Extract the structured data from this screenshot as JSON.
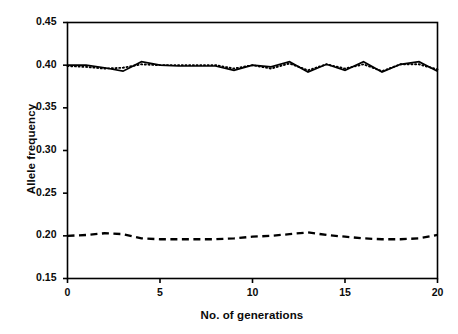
{
  "chart_data": {
    "type": "line",
    "title": "",
    "subtitle": "",
    "xlabel": "No. of generations",
    "ylabel": "Allele frequency",
    "xlim": [
      0,
      20
    ],
    "ylim": [
      0.15,
      0.45
    ],
    "xticks": [
      0,
      5,
      10,
      15,
      20
    ],
    "xtick_labels": [
      "0",
      "5",
      "10",
      "15",
      "20"
    ],
    "yticks": [
      0.15,
      0.2,
      0.25,
      0.3,
      0.35,
      0.4,
      0.45
    ],
    "ytick_labels": [
      "0.15",
      "0.20",
      "0.25",
      "0.30",
      "0.35",
      "0.40",
      "0.45"
    ],
    "grid": false,
    "legend": null,
    "legend_position": "none",
    "annotations": [],
    "x": [
      0,
      1,
      2,
      3,
      4,
      5,
      6,
      7,
      8,
      9,
      10,
      11,
      12,
      13,
      14,
      15,
      16,
      17,
      18,
      19,
      20
    ],
    "series": [
      {
        "name": "solid-line",
        "style": "solid",
        "color": "#000000",
        "values": [
          0.4,
          0.4,
          0.397,
          0.393,
          0.404,
          0.4,
          0.399,
          0.399,
          0.399,
          0.394,
          0.4,
          0.398,
          0.404,
          0.392,
          0.401,
          0.394,
          0.404,
          0.392,
          0.401,
          0.404,
          0.393
        ]
      },
      {
        "name": "dotted-line",
        "style": "dotted",
        "color": "#000000",
        "values": [
          0.399,
          0.398,
          0.396,
          0.397,
          0.401,
          0.4,
          0.4,
          0.4,
          0.4,
          0.396,
          0.4,
          0.396,
          0.402,
          0.394,
          0.401,
          0.396,
          0.401,
          0.393,
          0.401,
          0.401,
          0.395
        ]
      },
      {
        "name": "dashed-line",
        "style": "dashed",
        "color": "#000000",
        "values": [
          0.2,
          0.201,
          0.203,
          0.202,
          0.197,
          0.196,
          0.196,
          0.196,
          0.196,
          0.197,
          0.199,
          0.2,
          0.202,
          0.204,
          0.201,
          0.199,
          0.197,
          0.196,
          0.196,
          0.197,
          0.201
        ]
      }
    ]
  }
}
